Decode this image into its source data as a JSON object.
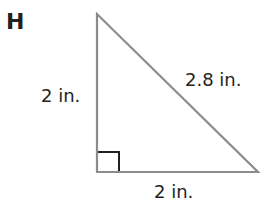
{
  "figure": {
    "letter": "H",
    "shape": "right triangle",
    "labels": {
      "left_leg": "2 in.",
      "hypotenuse": "2.8 in.",
      "bottom_leg": "2 in."
    },
    "right_angle_marker": true,
    "colors": {
      "triangle_stroke": "#8c8c8c",
      "right_angle_stroke": "#231f20",
      "text": "#231f20"
    }
  }
}
